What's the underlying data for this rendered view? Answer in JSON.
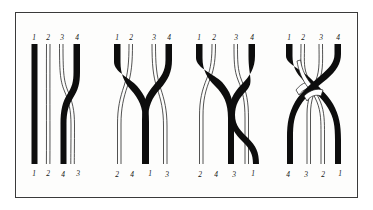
{
  "figure": {
    "background_color": "#ffffff",
    "frame_color": "#3a3a3a",
    "plate_color": "#fdfdfc",
    "black_strand_color": "#0d0d0d",
    "white_strand_color": "#ffffff",
    "outline_color": "#1a1a1a",
    "strand_count": 4,
    "panel_count": 4
  },
  "panels": [
    {
      "id": "braid-1",
      "name": "braid-diagram-1",
      "top_labels": [
        "1",
        "2",
        "3",
        "4"
      ],
      "bottom_labels": [
        "1",
        "2",
        "4",
        "3"
      ],
      "strand_colors": [
        "black",
        "white",
        "white",
        "black"
      ],
      "permutation": "1 2 4 3",
      "crossings": 1,
      "crossing_description": "strand 4 crosses over strand 3"
    },
    {
      "id": "braid-2",
      "name": "braid-diagram-2",
      "top_labels": [
        "1",
        "2",
        "3",
        "4"
      ],
      "bottom_labels": [
        "2",
        "4",
        "1",
        "3"
      ],
      "strand_colors": [
        "black",
        "white",
        "white",
        "black"
      ],
      "permutation": "2 4 1 3",
      "crossings": 3,
      "crossing_description": "black strands 1 and 4 cross over the white strands and each other"
    },
    {
      "id": "braid-3",
      "name": "braid-diagram-3",
      "top_labels": [
        "1",
        "2",
        "3",
        "4"
      ],
      "bottom_labels": [
        "2",
        "4",
        "3",
        "1"
      ],
      "strand_colors": [
        "black",
        "white",
        "white",
        "black"
      ],
      "permutation": "2 4 3 1",
      "crossings": 5,
      "crossing_description": "black strands 1 and 4 interlace through the white strands"
    },
    {
      "id": "braid-4",
      "name": "braid-diagram-4",
      "top_labels": [
        "1",
        "2",
        "3",
        "4"
      ],
      "bottom_labels": [
        "4",
        "3",
        "2",
        "1"
      ],
      "strand_colors": [
        "black",
        "white",
        "white",
        "black"
      ],
      "permutation": "4 3 2 1",
      "crossings": 6,
      "crossing_description": "full reversal; all four strands interlace"
    }
  ]
}
